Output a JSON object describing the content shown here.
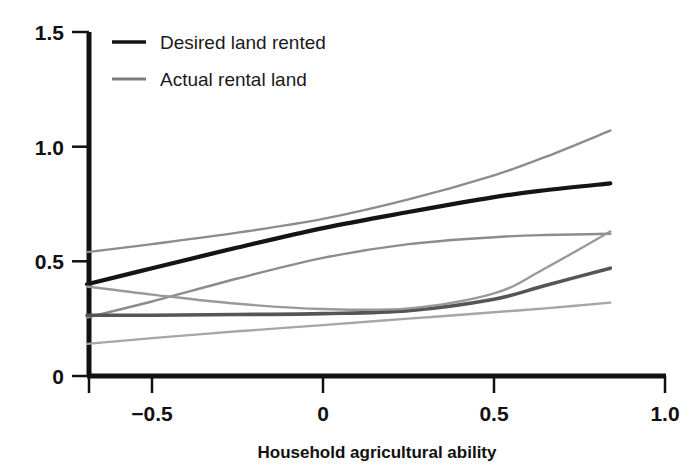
{
  "chart_data": {
    "type": "line",
    "title": "",
    "xlabel": "Household agricultural ability",
    "ylabel": "",
    "xlim": [
      -0.69,
      1.0
    ],
    "ylim": [
      0,
      1.5
    ],
    "xticks": [
      "-0.5",
      "0",
      "0.5",
      "1.0"
    ],
    "xtick_values": [
      -0.5,
      0,
      0.5,
      1.0
    ],
    "yticks": [
      "0",
      "0.5",
      "1.0",
      "1.5"
    ],
    "ytick_values": [
      0,
      0.5,
      1.0,
      1.5
    ],
    "grid": false,
    "legend_position": "top-left",
    "legend": [
      "Desired land rented",
      "Actual rental land"
    ],
    "series": [
      {
        "name": "Desired land rented",
        "role": "mean",
        "color": "#141414",
        "x": [
          -0.69,
          -0.5,
          -0.25,
          0.0,
          0.25,
          0.5,
          0.65,
          0.84
        ],
        "values": [
          0.4,
          0.47,
          0.56,
          0.645,
          0.715,
          0.78,
          0.81,
          0.84
        ]
      },
      {
        "name": "Desired land rented upper CI",
        "role": "ci-upper",
        "color": "#8c8c8c",
        "x": [
          -0.69,
          -0.5,
          -0.25,
          0.0,
          0.25,
          0.5,
          0.65,
          0.84
        ],
        "values": [
          0.54,
          0.575,
          0.625,
          0.685,
          0.77,
          0.875,
          0.955,
          1.07
        ]
      },
      {
        "name": "Desired land rented lower CI",
        "role": "ci-lower",
        "color": "#8c8c8c",
        "x": [
          -0.69,
          -0.5,
          -0.25,
          0.0,
          0.25,
          0.5,
          0.65,
          0.84
        ],
        "values": [
          0.255,
          0.325,
          0.425,
          0.515,
          0.575,
          0.605,
          0.615,
          0.62
        ]
      },
      {
        "name": "Actual rental land",
        "role": "mean",
        "color": "#555555",
        "x": [
          -0.69,
          -0.5,
          -0.25,
          0.0,
          0.25,
          0.5,
          0.65,
          0.84
        ],
        "values": [
          0.265,
          0.265,
          0.268,
          0.272,
          0.285,
          0.335,
          0.395,
          0.47
        ]
      },
      {
        "name": "Actual rental land upper CI",
        "role": "ci-upper",
        "color": "#999999",
        "x": [
          -0.69,
          -0.5,
          -0.25,
          0.0,
          0.25,
          0.5,
          0.65,
          0.84
        ],
        "values": [
          0.39,
          0.355,
          0.315,
          0.292,
          0.295,
          0.36,
          0.47,
          0.63
        ]
      },
      {
        "name": "Actual rental land lower CI",
        "role": "ci-lower",
        "color": "#a6a6a6",
        "x": [
          -0.69,
          -0.5,
          -0.25,
          0.0,
          0.25,
          0.5,
          0.65,
          0.84
        ],
        "values": [
          0.14,
          0.165,
          0.195,
          0.222,
          0.25,
          0.278,
          0.295,
          0.32
        ]
      }
    ]
  },
  "axis": {
    "x_title": "Household agricultural ability",
    "xtick_0": "−0.5",
    "xtick_1": "0",
    "xtick_2": "0.5",
    "xtick_3": "1.0",
    "ytick_0": "0",
    "ytick_1": "0.5",
    "ytick_2": "1.0",
    "ytick_3": "1.5"
  },
  "legend": {
    "item_0": "Desired land rented",
    "item_1": "Actual rental land"
  },
  "colors": {
    "desired_line": "#141414",
    "actual_line": "#555555",
    "ci_band": "#8c8c8c",
    "axis": "#111111",
    "background": "#ffffff"
  }
}
